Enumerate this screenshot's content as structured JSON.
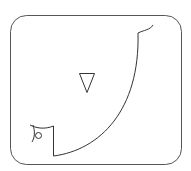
{
  "diagram": {
    "stroke_color": "#333333",
    "background_color": "#ffffff",
    "shapes": [
      "rounded-frame",
      "downward-triangle",
      "large-curve",
      "top-hook",
      "left-bracket",
      "small-circle"
    ]
  }
}
